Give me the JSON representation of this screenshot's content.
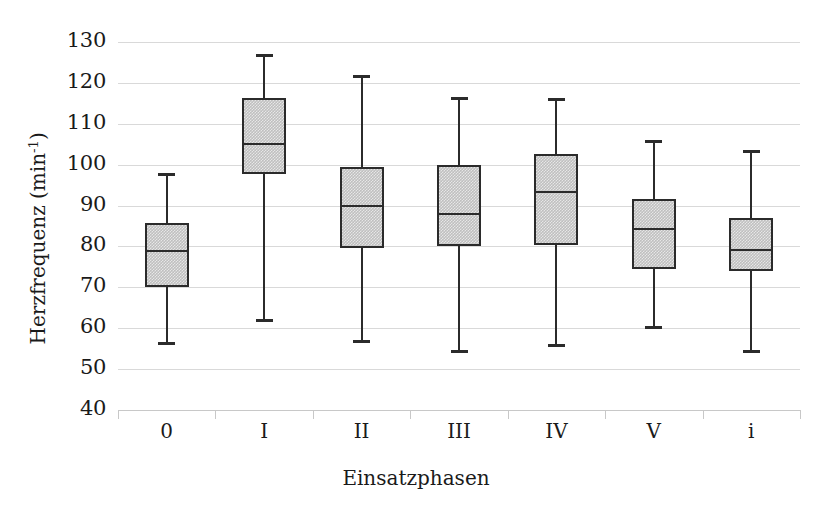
{
  "chart_data": {
    "type": "box",
    "title": "",
    "xlabel": "Einsatzphasen",
    "ylabel": "Herzfrequenz (min⁻¹)",
    "ylabel_text": "Herzfrequenz (min",
    "ylabel_sup": "-1",
    "ylabel_tail": ")",
    "categories": [
      "0",
      "I",
      "II",
      "III",
      "IV",
      "V",
      "i"
    ],
    "ylim": [
      40,
      130
    ],
    "yticks": [
      130,
      120,
      110,
      100,
      90,
      80,
      70,
      60,
      50,
      40
    ],
    "ytick_labels": [
      "130",
      "120",
      "110",
      "100",
      "90",
      "80",
      "70",
      "60",
      "50",
      "40"
    ],
    "grid": true,
    "legend": "none",
    "box_fill_color": "#bfbfbf",
    "box_line_color": "#2b2b2b",
    "gridline_color": "#d9d9d9",
    "boxes": [
      {
        "category": "0",
        "whisker_low": 55.8,
        "q1": 70.0,
        "median": 79.0,
        "q3": 85.8,
        "whisker_high": 98.0
      },
      {
        "category": "I",
        "whisker_low": 61.5,
        "q1": 97.8,
        "median": 105.0,
        "q3": 116.3,
        "whisker_high": 127.0
      },
      {
        "category": "II",
        "whisker_low": 56.5,
        "q1": 79.5,
        "median": 89.8,
        "q3": 99.5,
        "whisker_high": 122.0
      },
      {
        "category": "III",
        "whisker_low": 54.0,
        "q1": 80.2,
        "median": 88.0,
        "q3": 100.0,
        "whisker_high": 116.5
      },
      {
        "category": "IV",
        "whisker_low": 55.5,
        "q1": 80.3,
        "median": 93.3,
        "q3": 102.6,
        "whisker_high": 116.3
      },
      {
        "category": "V",
        "whisker_low": 59.9,
        "q1": 74.6,
        "median": 84.3,
        "q3": 91.6,
        "whisker_high": 106.0
      },
      {
        "category": "i",
        "whisker_low": 54.0,
        "q1": 74.0,
        "median": 79.2,
        "q3": 87.0,
        "whisker_high": 103.5
      }
    ]
  }
}
